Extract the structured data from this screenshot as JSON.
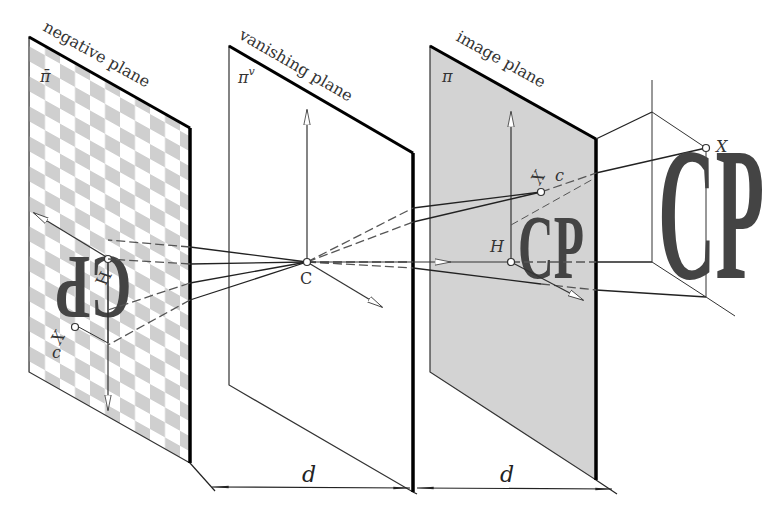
{
  "figure": {
    "type": "perspective-projection-diagram",
    "planes": [
      {
        "id": "negative",
        "label": "negative plane",
        "symbol": "π̄",
        "fill": "checkerboard"
      },
      {
        "id": "vanishing",
        "label": "vanishing plane",
        "symbol": "πᵛ",
        "fill": "#ffffff"
      },
      {
        "id": "image",
        "label": "image plane",
        "symbol": "π",
        "fill": "#d3d3d3"
      }
    ],
    "points": {
      "center": "C",
      "principal_image": "H",
      "principal_negative": "H",
      "object_point": "X",
      "image_point": "X",
      "image_point_sub": "c",
      "negative_point": "X",
      "negative_point_sub": "c"
    },
    "object_text": "CP",
    "negative_text": "CP",
    "dimensions": [
      {
        "label": "d",
        "between": [
          "negative plane",
          "vanishing plane"
        ]
      },
      {
        "label": "d",
        "between": [
          "vanishing plane",
          "image plane"
        ]
      }
    ],
    "colors": {
      "line": "#222222",
      "plane_edge": "#000000",
      "image_plane_fill": "#d3d3d3",
      "checker_dark": "#cfcfcf",
      "checker_light": "#ffffff",
      "letters": "#4a4a4a",
      "text": "#333333"
    }
  }
}
